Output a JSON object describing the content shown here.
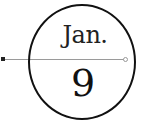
{
  "date_badge": {
    "month": "Jan.",
    "day": "9"
  },
  "colors": {
    "ring": "#111111",
    "line": "#9a9a9a",
    "text": "#222222"
  }
}
